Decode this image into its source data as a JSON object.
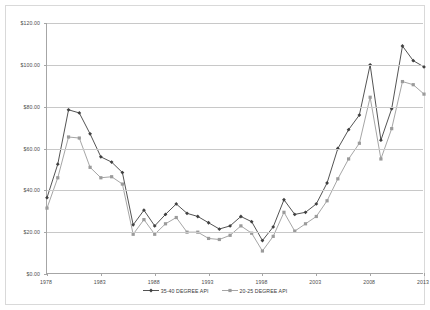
{
  "chart_data": {
    "type": "line",
    "title": "",
    "xlabel": "",
    "ylabel": "",
    "grid": true,
    "legend_position": "bottom",
    "ylim": [
      0,
      120
    ],
    "ytick_values": [
      0,
      20,
      40,
      60,
      80,
      100,
      120
    ],
    "ytick_labels": [
      "$0.00",
      "$20.00",
      "$40.00",
      "$60.00",
      "$80.00",
      "$100.00",
      "$120.00"
    ],
    "xlim": [
      1978,
      2013
    ],
    "xtick_values": [
      1978,
      1983,
      1988,
      1993,
      1998,
      2003,
      2008,
      2013
    ],
    "xtick_labels": [
      "1978",
      "1983",
      "1988",
      "1993",
      "1998",
      "2003",
      "2008",
      "2013"
    ],
    "x": [
      1978,
      1979,
      1980,
      1981,
      1982,
      1983,
      1984,
      1985,
      1986,
      1987,
      1988,
      1989,
      1990,
      1991,
      1992,
      1993,
      1994,
      1995,
      1996,
      1997,
      1998,
      1999,
      2000,
      2001,
      2002,
      2003,
      2004,
      2005,
      2006,
      2007,
      2008,
      2009,
      2010,
      2011,
      2012,
      2013
    ],
    "series": [
      {
        "name": "35-40 DEGREE API",
        "color": "#404040",
        "marker": "diamond",
        "values": [
          36.5,
          52.5,
          78.5,
          77.0,
          67.0,
          56.0,
          53.5,
          48.5,
          23.5,
          30.5,
          23.0,
          28.5,
          33.5,
          29.0,
          27.5,
          24.5,
          21.5,
          23.0,
          27.5,
          25.0,
          16.0,
          22.5,
          35.5,
          28.5,
          29.5,
          33.5,
          43.5,
          60.0,
          69.0,
          76.0,
          100.0,
          64.0,
          79.0,
          109.0,
          102.0,
          99.0
        ]
      },
      {
        "name": "20-25 DEGREE API",
        "color": "#9b9b9b",
        "marker": "square",
        "values": [
          31.5,
          46.0,
          65.5,
          65.0,
          51.0,
          46.0,
          46.5,
          43.0,
          19.0,
          26.0,
          19.0,
          24.0,
          27.0,
          20.0,
          20.0,
          17.0,
          16.5,
          18.5,
          23.0,
          19.5,
          11.0,
          18.0,
          29.5,
          20.5,
          24.0,
          27.5,
          35.0,
          45.5,
          55.0,
          62.5,
          84.5,
          55.0,
          69.5,
          92.0,
          90.5,
          86.0
        ]
      }
    ]
  },
  "legend": {
    "entries": [
      {
        "label": "35-40 DEGREE API"
      },
      {
        "label": "20-25 DEGREE API"
      }
    ]
  }
}
